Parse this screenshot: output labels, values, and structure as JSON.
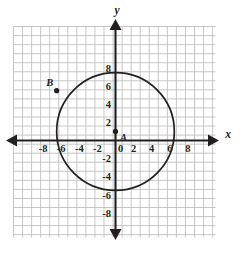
{
  "chart_data": {
    "type": "scatter",
    "title": "",
    "xlabel": "x",
    "ylabel": "y",
    "grid": true,
    "legend": false,
    "xlim": [
      -9,
      9.5
    ],
    "ylim": [
      -9.5,
      9
    ],
    "x_ticks": [
      -8,
      -6,
      -4,
      -2,
      0,
      2,
      4,
      6,
      8
    ],
    "y_ticks": [
      8,
      6,
      4,
      2,
      -2,
      -4,
      -6,
      -8
    ],
    "x_tick_labels": [
      "-8",
      "-6",
      "-4",
      "-2",
      "0",
      "2",
      "4",
      "6",
      "8"
    ],
    "y_tick_labels": [
      "8",
      "6",
      "4",
      "2",
      "-2",
      "-4",
      "-6",
      "-8"
    ],
    "grid_step": 1,
    "points": [
      {
        "label": "A",
        "x": 0,
        "y": 1,
        "role": "center"
      },
      {
        "label": "B",
        "x": -6.5,
        "y": 5.5,
        "role": "on-circle"
      }
    ],
    "shapes": [
      {
        "type": "circle",
        "center_x": 0,
        "center_y": 1,
        "radius": 6.5,
        "stroke": "#231f20",
        "fill": "none"
      }
    ]
  },
  "axes": {
    "x_label": "x",
    "y_label": "y"
  },
  "ticks": {
    "x": [
      {
        "value": -8,
        "text": "-8"
      },
      {
        "value": -6,
        "text": "-6"
      },
      {
        "value": -4,
        "text": "-4"
      },
      {
        "value": -2,
        "text": "-2"
      },
      {
        "value": 0,
        "text": "0"
      },
      {
        "value": 2,
        "text": "2"
      },
      {
        "value": 4,
        "text": "4"
      },
      {
        "value": 6,
        "text": "6"
      },
      {
        "value": 8,
        "text": "8"
      }
    ],
    "y": [
      {
        "value": 8,
        "text": "8"
      },
      {
        "value": 6,
        "text": "6"
      },
      {
        "value": 4,
        "text": "4"
      },
      {
        "value": 2,
        "text": "2"
      },
      {
        "value": -2,
        "text": "-2"
      },
      {
        "value": -4,
        "text": "-4"
      },
      {
        "value": -6,
        "text": "-6"
      },
      {
        "value": -8,
        "text": "-8"
      }
    ]
  },
  "points": {
    "a": {
      "label": "A"
    },
    "b": {
      "label": "B"
    }
  },
  "colors": {
    "grid": "#b9b9b9",
    "axis": "#231f20",
    "curve": "#231f20",
    "background": "#ffffff"
  }
}
